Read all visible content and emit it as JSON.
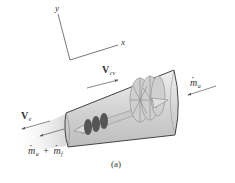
{
  "figure": {
    "caption": "(a)",
    "axes": {
      "x_label": "x",
      "y_label": "y"
    },
    "labels": {
      "v_cv": {
        "main": "V",
        "sub": "cv"
      },
      "m_a_inlet": {
        "main": "m",
        "sub": "a"
      },
      "v_e": {
        "main": "V",
        "sub": "e"
      },
      "m_out": {
        "first_main": "m",
        "first_sub": "a",
        "operator": "+",
        "second_main": "m",
        "second_sub": "f"
      }
    },
    "colors": {
      "line": "#555555",
      "text": "#333333",
      "engine_shell": "#d9d9d9",
      "engine_outline": "#444444",
      "exhaust": "#e6e6e6"
    }
  }
}
